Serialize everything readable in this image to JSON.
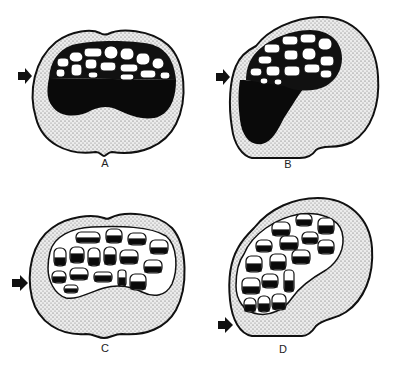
{
  "figure": {
    "colors": {
      "background": "#ffffff",
      "outline": "#111111",
      "stipple": "#e2e2e2",
      "stipple_dot": "#555555",
      "fill_black": "#0a0a0a",
      "cell_white": "#ffffff"
    },
    "panels": [
      {
        "id": "A",
        "label": "A",
        "arrow": "arrow-right"
      },
      {
        "id": "B",
        "label": "B",
        "arrow": "arrow-right"
      },
      {
        "id": "C",
        "label": "C",
        "arrow": "arrow-right"
      },
      {
        "id": "D",
        "label": "D",
        "arrow": "arrow-right"
      }
    ]
  }
}
